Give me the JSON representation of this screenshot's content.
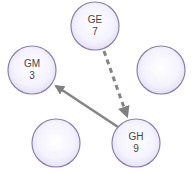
{
  "diagram": {
    "type": "graph",
    "colors": {
      "node_border": "#8a80b0",
      "node_fill_center": "#ffffff",
      "node_fill_edge": "#e6e2f6",
      "edge": "#808080",
      "text": "#444444"
    },
    "nodes": [
      {
        "id": "GE",
        "name": "GE",
        "value": "7",
        "cx": 95,
        "cy": 26,
        "r": 24
      },
      {
        "id": "GM",
        "name": "GM",
        "value": "3",
        "cx": 32,
        "cy": 70,
        "r": 24
      },
      {
        "id": "empty-right",
        "name": "",
        "value": "",
        "cx": 161,
        "cy": 70,
        "r": 24
      },
      {
        "id": "empty-bottom-left",
        "name": "",
        "value": "",
        "cx": 56,
        "cy": 143,
        "r": 24
      },
      {
        "id": "GH",
        "name": "GH",
        "value": "9",
        "cx": 136,
        "cy": 143,
        "r": 24
      }
    ],
    "edges": [
      {
        "from": "GE",
        "to": "GH",
        "style": "dashed"
      },
      {
        "from": "GH",
        "to": "GM",
        "style": "solid"
      }
    ]
  }
}
